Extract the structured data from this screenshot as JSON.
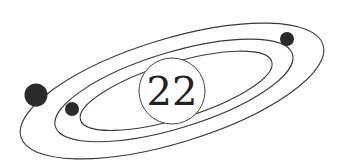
{
  "diagram": {
    "type": "atom-orbit",
    "nucleus_label": "22",
    "colors": {
      "orbit": "#3a3a3a",
      "electron": "#2b2b2b",
      "nucleus_stroke": "#444444",
      "background": "#ffffff"
    },
    "orbits": 3,
    "electrons": 3
  }
}
